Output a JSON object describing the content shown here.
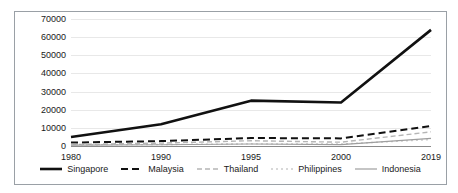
{
  "chart_data": {
    "type": "line",
    "title": "",
    "subtitle": "",
    "xlabel": "",
    "ylabel": "",
    "categories": [
      "1980",
      "1990",
      "1995",
      "2000",
      "2019"
    ],
    "ylim": [
      0,
      70000
    ],
    "ytick_labels": [
      "0",
      "10000",
      "20000",
      "30000",
      "40000",
      "50000",
      "60000",
      "70000"
    ],
    "yticks": [
      0,
      10000,
      20000,
      30000,
      40000,
      50000,
      60000,
      70000
    ],
    "grid": true,
    "legend_position": "bottom",
    "series": [
      {
        "name": "Singapore",
        "values": [
          5000,
          12000,
          25000,
          24000,
          64000
        ],
        "color": "#111111",
        "style": "solid",
        "width": 2.6
      },
      {
        "name": "Malaysia",
        "values": [
          1900,
          2700,
          4400,
          4200,
          11000
        ],
        "color": "#111111",
        "style": "dashed",
        "width": 2.0
      },
      {
        "name": "Thailand",
        "values": [
          800,
          1600,
          2900,
          2100,
          7800
        ],
        "color": "#b5b5b5",
        "style": "dashed",
        "width": 1.4
      },
      {
        "name": "Philippines",
        "values": [
          700,
          800,
          1200,
          1100,
          3500
        ],
        "color": "#cccccc",
        "style": "dotted",
        "width": 1.4
      },
      {
        "name": "Indonesia",
        "values": [
          500,
          700,
          1100,
          800,
          4200
        ],
        "color": "#9e9e9e",
        "style": "solid",
        "width": 1.2
      }
    ]
  }
}
